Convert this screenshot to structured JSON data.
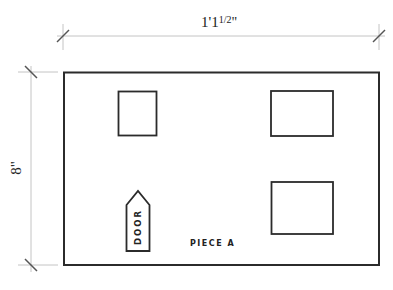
{
  "drawing": {
    "piece_label": "PIECE A",
    "door_label": "DOOR",
    "width_dimension": "1'1½\"",
    "width_dimension_main": "1'1",
    "width_dimension_fraction": "1/2",
    "width_dimension_suffix": "\"",
    "height_dimension": "8\"",
    "colors": {
      "outline": "#2b2b2b",
      "dimension_line": "#bdbdbd",
      "tick": "#555555",
      "text": "#222222"
    }
  }
}
